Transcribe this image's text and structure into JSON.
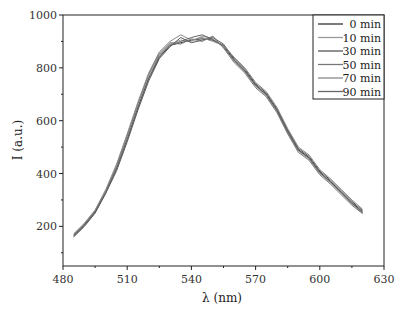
{
  "chart_data": {
    "type": "line",
    "title": "",
    "xlabel": "λ (nm)",
    "ylabel": "I (a.u.)",
    "xlim": [
      480,
      630
    ],
    "ylim": [
      50,
      1000
    ],
    "x_ticks": [
      "480",
      "510",
      "540",
      "570",
      "600",
      "630"
    ],
    "y_ticks": [
      "200",
      "400",
      "600",
      "800",
      "1000"
    ],
    "grid": false,
    "legend_position": "upper right",
    "x": [
      485,
      490,
      495,
      500,
      505,
      510,
      515,
      520,
      525,
      530,
      535,
      540,
      545,
      550,
      555,
      560,
      565,
      570,
      575,
      580,
      585,
      590,
      595,
      600,
      605,
      610,
      615,
      620
    ],
    "series": [
      {
        "name": "0 min",
        "color": "#333333",
        "values": [
          165,
          205,
          255,
          330,
          420,
          530,
          650,
          760,
          840,
          885,
          895,
          905,
          910,
          905,
          885,
          830,
          790,
          735,
          700,
          640,
          560,
          490,
          460,
          405,
          370,
          330,
          290,
          255
        ]
      },
      {
        "name": "10 min",
        "color": "#9a9a9a",
        "values": [
          170,
          210,
          260,
          335,
          425,
          540,
          660,
          770,
          850,
          890,
          905,
          900,
          920,
          910,
          880,
          825,
          785,
          730,
          695,
          635,
          555,
          485,
          455,
          400,
          365,
          325,
          285,
          250
        ]
      },
      {
        "name": "30 min",
        "color": "#555555",
        "values": [
          160,
          200,
          250,
          325,
          410,
          520,
          640,
          750,
          835,
          880,
          915,
          895,
          905,
          915,
          890,
          835,
          795,
          740,
          705,
          645,
          565,
          495,
          465,
          410,
          375,
          335,
          295,
          260
        ]
      },
      {
        "name": "50 min",
        "color": "#777777",
        "values": [
          168,
          208,
          258,
          332,
          430,
          545,
          665,
          775,
          855,
          895,
          890,
          910,
          900,
          920,
          875,
          820,
          780,
          725,
          690,
          630,
          550,
          480,
          450,
          395,
          360,
          320,
          280,
          248
        ]
      },
      {
        "name": "70 min",
        "color": "#8a8a8a",
        "values": [
          172,
          212,
          262,
          340,
          435,
          550,
          670,
          780,
          860,
          900,
          925,
          905,
          915,
          900,
          885,
          840,
          800,
          745,
          710,
          650,
          570,
          500,
          470,
          415,
          380,
          340,
          300,
          265
        ]
      },
      {
        "name": "90 min",
        "color": "#666666",
        "values": [
          163,
          203,
          253,
          328,
          418,
          528,
          648,
          758,
          845,
          885,
          900,
          915,
          925,
          908,
          880,
          828,
          788,
          733,
          698,
          638,
          558,
          488,
          458,
          403,
          368,
          328,
          288,
          252
        ]
      }
    ]
  }
}
